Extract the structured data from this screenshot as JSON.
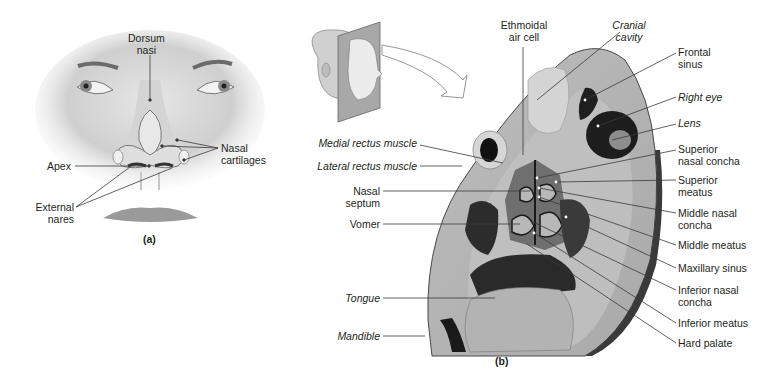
{
  "figure": {
    "panels": [
      {
        "id": "a",
        "panel_label": "(a)",
        "subject": "Anterior view of the nose",
        "labels": {
          "dorsum_nasi_1": "Dorsum",
          "dorsum_nasi_2": "nasi",
          "nasal_cartilages_1": "Nasal",
          "nasal_cartilages_2": "cartilages",
          "apex": "Apex",
          "external_nares_1": "External",
          "external_nares_2": "nares"
        }
      },
      {
        "id": "b",
        "panel_label": "(b)",
        "subject": "Frontal section through the head (orientation inset shows head with sectional plane)",
        "labels_left": {
          "medial_rectus": "Medial rectus muscle",
          "lateral_rectus": "Lateral rectus muscle",
          "nasal_septum_1": "Nasal",
          "nasal_septum_2": "septum",
          "vomer": "Vomer",
          "tongue": "Tongue",
          "mandible": "Mandible"
        },
        "labels_top": {
          "ethmoidal_1": "Ethmoidal",
          "ethmoidal_2": "air cell",
          "cranial_1": "Cranial",
          "cranial_2": "cavity"
        },
        "labels_right": {
          "frontal_sinus_1": "Frontal",
          "frontal_sinus_2": "sinus",
          "right_eye": "Right eye",
          "lens": "Lens",
          "sup_concha_1": "Superior",
          "sup_concha_2": "nasal concha",
          "sup_meatus_1": "Superior",
          "sup_meatus_2": "meatus",
          "mid_concha_1": "Middle nasal",
          "mid_concha_2": "concha",
          "mid_meatus": "Middle meatus",
          "maxillary_sinus": "Maxillary sinus",
          "inf_concha_1": "Inferior nasal",
          "inf_concha_2": "concha",
          "inf_meatus": "Inferior meatus",
          "hard_palate": "Hard palate"
        }
      }
    ],
    "colors": {
      "text": "#231f20",
      "leader_line": "#3a3a3a",
      "tissue_light": "#c9c9c9",
      "tissue_mid": "#a8a8a8",
      "tissue_dark": "#5a5a5a",
      "cavity": "#1a1a1a",
      "skin": "#dcdcdc"
    }
  }
}
